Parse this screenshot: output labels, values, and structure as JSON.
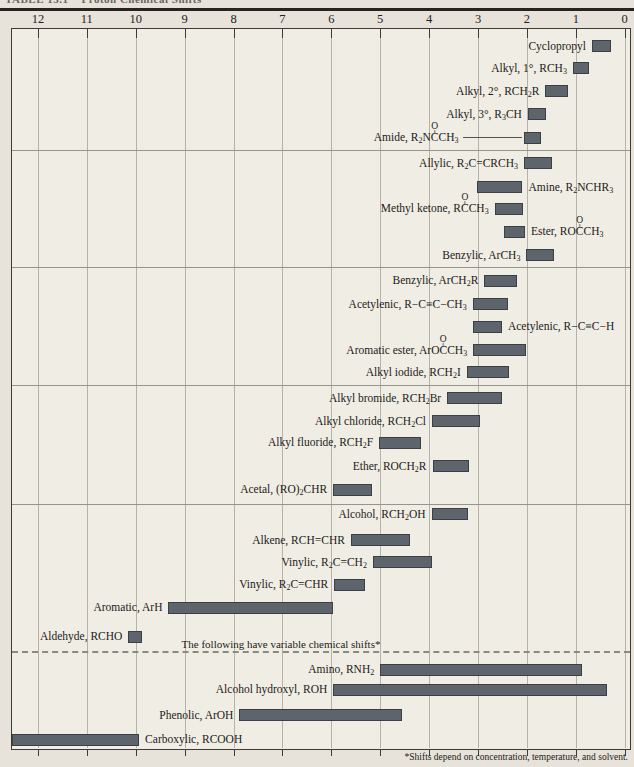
{
  "chart_data": {
    "type": "bar",
    "orientation": "horizontal-range",
    "title_partial": "TABLE 13.1    Proton Chemical Shifts",
    "x_axis": {
      "ticks": [
        12,
        11,
        10,
        9,
        8,
        7,
        6,
        5,
        4,
        3,
        2,
        1,
        0
      ],
      "unit": "ppm (delta scale)",
      "direction": "values decrease left-to-right",
      "range": [
        0,
        12
      ],
      "grid": true
    },
    "bar_color": "#5d646c",
    "variable_note": "The following have variable chemical shifts*",
    "footnote": "*Shifts depend on concentration, temperature, and solvent.",
    "dividers_y": [
      150,
      267,
      385,
      504
    ],
    "dashed_divider_y": 651,
    "rows": [
      {
        "label": "Cyclopropyl",
        "shift_range": [
          0.27,
          0.67
        ],
        "y": 46,
        "side": "left"
      },
      {
        "label": "Alkyl, 1°, RCH_3_",
        "shift_range": [
          0.73,
          1.06
        ],
        "y": 68,
        "side": "left"
      },
      {
        "label": "Alkyl, 2°, RCH_2_R",
        "shift_range": [
          1.15,
          1.62
        ],
        "y": 91,
        "side": "left"
      },
      {
        "label": "Alkyl, 3°, R_3_CH",
        "shift_range": [
          1.61,
          1.98
        ],
        "y": 114,
        "side": "left"
      },
      {
        "label": "Amide, R_2_N[C]CH_3_",
        "shift_range": [
          1.71,
          2.05
        ],
        "y": 137.5,
        "side": "left",
        "leader": true
      },
      {
        "label": "Allylic, R_2_C=CRCH_3_",
        "shift_range": [
          1.49,
          2.06
        ],
        "y": 163,
        "side": "left"
      },
      {
        "label": "Amine, R_2_NCHR_3_",
        "shift_range": [
          2.09,
          3.03
        ],
        "y": 187,
        "side": "right"
      },
      {
        "label": "Methyl ketone, R[C]CH_3_",
        "shift_range": [
          2.07,
          2.66
        ],
        "y": 208.5,
        "side": "left"
      },
      {
        "label": "Ester, RO[C]CH_3_",
        "shift_range": [
          2.04,
          2.46
        ],
        "y": 231.5,
        "side": "right"
      },
      {
        "label": "Benzylic, ArCH_3_",
        "shift_range": [
          1.44,
          2.01
        ],
        "y": 255,
        "side": "left"
      },
      {
        "label": "Benzylic, ArCH_2_R",
        "shift_range": [
          2.2,
          2.87
        ],
        "y": 280.5,
        "side": "left"
      },
      {
        "label": "Acetylenic, R−C≡C−CH_3_",
        "shift_range": [
          2.39,
          3.11
        ],
        "y": 304,
        "side": "left"
      },
      {
        "label": "Acetylenic, R−C≡C−H",
        "shift_range": [
          2.51,
          3.1
        ],
        "y": 326.5,
        "side": "right"
      },
      {
        "label": "Aromatic ester, ArO[C]CH_3_",
        "shift_range": [
          2.01,
          3.1
        ],
        "y": 350,
        "side": "left"
      },
      {
        "label": "Alkyl iodide, RCH_2_I",
        "shift_range": [
          2.36,
          3.23
        ],
        "y": 372,
        "side": "left"
      },
      {
        "label": "Alkyl bromide, RCH_2_Br",
        "shift_range": [
          2.5,
          3.63
        ],
        "y": 398,
        "side": "left"
      },
      {
        "label": "Alkyl chloride, RCH_2_Cl",
        "shift_range": [
          2.96,
          3.94
        ],
        "y": 421,
        "side": "left"
      },
      {
        "label": "Alkyl fluoride, RCH_2_F",
        "shift_range": [
          4.17,
          5.02
        ],
        "y": 442.5,
        "side": "left"
      },
      {
        "label": "Ether, ROCH_2_R",
        "shift_range": [
          3.18,
          3.93
        ],
        "y": 466,
        "side": "left"
      },
      {
        "label": "Acetal, (RO)_2_CHR",
        "shift_range": [
          5.17,
          5.96
        ],
        "y": 489.5,
        "side": "left"
      },
      {
        "label": "Alcohol, RCH_2_OH",
        "shift_range": [
          3.2,
          3.95
        ],
        "y": 514,
        "side": "left"
      },
      {
        "label": "Alkene, RCH=CHR",
        "shift_range": [
          4.4,
          5.6
        ],
        "y": 540,
        "side": "left"
      },
      {
        "label": "Vinylic, R_2_C=CH_2_",
        "shift_range": [
          3.95,
          5.15
        ],
        "y": 562,
        "side": "left"
      },
      {
        "label": "Vinylic, R_2_C=CHR",
        "shift_range": [
          5.31,
          5.94
        ],
        "y": 584.5,
        "side": "left"
      },
      {
        "label": "Aromatic, ArH",
        "shift_range": [
          5.96,
          9.33
        ],
        "y": 607.5,
        "side": "left"
      },
      {
        "label": "Aldehyde, RCHO",
        "shift_range": [
          9.87,
          10.15
        ],
        "y": 636.5,
        "side": "left"
      },
      {
        "label": "Amino, RNH_2_",
        "shift_range": [
          0.88,
          5.0
        ],
        "y": 669.5,
        "side": "left"
      },
      {
        "label": "Alcohol hydroxyl, ROH",
        "shift_range": [
          0.37,
          5.96
        ],
        "y": 689.5,
        "side": "left"
      },
      {
        "label": "Phenolic, ArOH",
        "shift_range": [
          4.56,
          7.88
        ],
        "y": 715,
        "side": "left"
      },
      {
        "label": "Carboxylic, RCOOH",
        "shift_range": [
          9.93,
          12.53
        ],
        "y": 739.5,
        "side": "right"
      }
    ]
  }
}
